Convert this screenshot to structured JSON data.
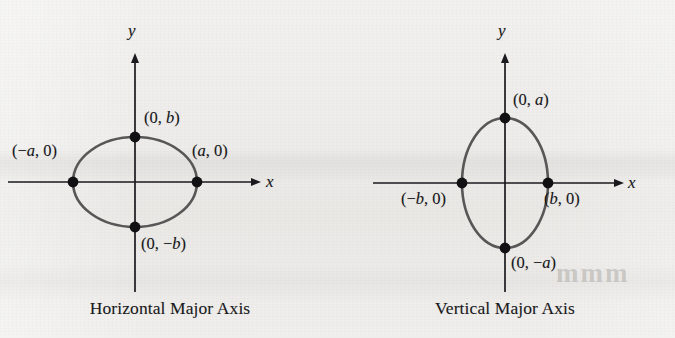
{
  "figure": {
    "background_color": "#efeeec",
    "axis_color": "#1a1a1e",
    "curve_color": "#575757",
    "point_color": "#111114",
    "text_color": "#17161a"
  },
  "panels": [
    {
      "id": "horizontal-major-axis",
      "caption": "Horizontal Major Axis",
      "axis_labels": {
        "x": "x",
        "y": "y"
      },
      "ellipse": {
        "center_x": 135,
        "center_y": 182,
        "semi_axis_x": 62,
        "semi_axis_y": 45,
        "orientation": "horizontal"
      },
      "axes": {
        "x_start": 8,
        "x_end": 262,
        "y_top": 52,
        "y_bottom": 292
      },
      "vertices": [
        {
          "name": "left-vertex",
          "label": "(−a, 0)",
          "cx": 73,
          "cy": 182
        },
        {
          "name": "right-vertex",
          "label": "(a, 0)",
          "cx": 197,
          "cy": 182
        },
        {
          "name": "top-covertex",
          "label": "(0, b)",
          "cx": 135,
          "cy": 137
        },
        {
          "name": "bottom-covertex",
          "label": "(0, −b)",
          "cx": 135,
          "cy": 227
        }
      ],
      "label_text": {
        "left": {
          "pre": "(−",
          "var": "a",
          "post": ", 0)"
        },
        "right": {
          "pre": "(",
          "var": "a",
          "post": ", 0)"
        },
        "top": {
          "pre": "(0, ",
          "var": "b",
          "post": ")"
        },
        "bottom": {
          "pre": "(0, −",
          "var": "b",
          "post": ")"
        }
      }
    },
    {
      "id": "vertical-major-axis",
      "caption": "Vertical Major Axis",
      "axis_labels": {
        "x": "x",
        "y": "y"
      },
      "ellipse": {
        "center_x": 170,
        "center_y": 183,
        "semi_axis_x": 43,
        "semi_axis_y": 65,
        "orientation": "vertical"
      },
      "axes": {
        "x_start": 38,
        "x_end": 290,
        "y_top": 52,
        "y_bottom": 292
      },
      "vertices": [
        {
          "name": "left-covertex",
          "label": "(−b, 0)",
          "cx": 127,
          "cy": 183
        },
        {
          "name": "right-covertex",
          "label": "(b, 0)",
          "cx": 213,
          "cy": 183
        },
        {
          "name": "top-vertex",
          "label": "(0, a)",
          "cx": 170,
          "cy": 118
        },
        {
          "name": "bottom-vertex",
          "label": "(0, −a)",
          "cx": 170,
          "cy": 248
        }
      ],
      "label_text": {
        "left": {
          "pre": "(−",
          "var": "b",
          "post": ", 0)"
        },
        "right": {
          "pre": "(",
          "var": "b",
          "post": ", 0)"
        },
        "top": {
          "pre": "(0, ",
          "var": "a",
          "post": ")"
        },
        "bottom": {
          "pre": "(0, −",
          "var": "a",
          "post": ")"
        }
      }
    }
  ],
  "watermarks": {
    "right_fragment": "mmm",
    "mid_fragment": " "
  }
}
